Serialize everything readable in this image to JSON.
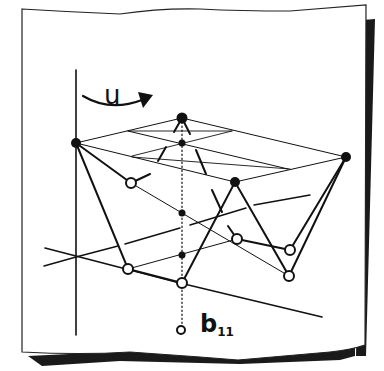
{
  "diagram": {
    "type": "hand-drawn 3D lattice / network sketch on paper sheet",
    "labels": {
      "rotation": "u",
      "node_label_main": "b",
      "node_label_sub": "11"
    },
    "colors": {
      "ink": "#111111",
      "paper": "#ffffff",
      "shadow": "#1a1a1a"
    },
    "filled_nodes": [
      {
        "id": "A",
        "x": 76,
        "y": 143
      },
      {
        "id": "B",
        "x": 182,
        "y": 118
      },
      {
        "id": "C",
        "x": 235,
        "y": 182
      },
      {
        "id": "D",
        "x": 346,
        "y": 157
      }
    ],
    "small_filled_nodes": [
      {
        "id": "m1",
        "x": 182,
        "y": 143
      },
      {
        "id": "m2",
        "x": 182,
        "y": 213
      },
      {
        "id": "m3",
        "x": 182,
        "y": 255
      }
    ],
    "open_nodes": [
      {
        "id": "o1",
        "x": 131,
        "y": 183
      },
      {
        "id": "o2",
        "x": 128,
        "y": 269
      },
      {
        "id": "o3",
        "x": 182,
        "y": 283
      },
      {
        "id": "o4",
        "x": 237,
        "y": 239
      },
      {
        "id": "o5",
        "x": 290,
        "y": 250
      },
      {
        "id": "o6",
        "x": 289,
        "y": 276
      },
      {
        "id": "b11",
        "x": 181,
        "y": 330
      }
    ]
  }
}
